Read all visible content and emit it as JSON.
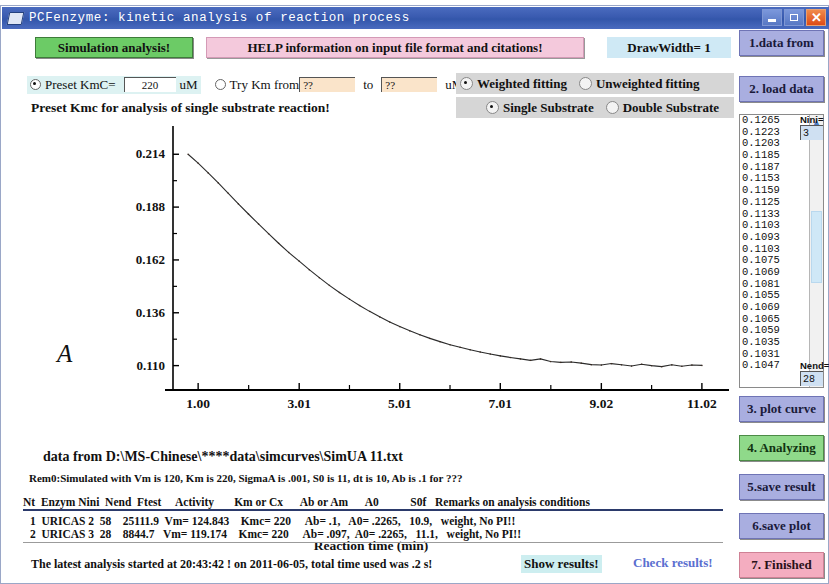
{
  "window": {
    "title": "PCFenzyme: kinetic analysis of reaction process",
    "minimize_label": "_",
    "maximize_label": "□",
    "close_label": "✕"
  },
  "toolbar": {
    "simulation_button": "Simulation analysis!",
    "help_button": "HELP information on input file format and citations!",
    "drawwidth_label": "DrawWidth= 1"
  },
  "options": {
    "preset_kmc_label": "Preset KmC=",
    "preset_kmc_value": "220",
    "preset_kmc_unit": "uM",
    "try_km_label": "Try Km from",
    "try_km_from_value": "??",
    "try_km_to_label": "to",
    "try_km_to_value": "??",
    "try_km_unit": "uM",
    "weighted_fitting": "Weighted fitting",
    "unweighted_fitting": "Unweighted fitting",
    "single_substrate": "Single Substrate",
    "double_substrate": "Double  Substrate",
    "hint": "Preset Kmc for analysis of single substrate reaction!"
  },
  "chart_data": {
    "type": "line",
    "title": "",
    "xlabel": "Reaction time (min)",
    "ylabel": "A",
    "xticks": [
      "1.00",
      "3.01",
      "5.01",
      "7.01",
      "9.02",
      "11.02"
    ],
    "xtick_values": [
      1.0,
      3.01,
      5.01,
      7.01,
      9.02,
      11.02
    ],
    "yticks": [
      "0.214",
      "0.188",
      "0.162",
      "0.136",
      "0.110"
    ],
    "ytick_values": [
      0.214,
      0.188,
      0.162,
      0.136,
      0.11
    ],
    "xlim": [
      0.5,
      11.4
    ],
    "ylim": [
      0.098,
      0.222
    ],
    "grid": false,
    "legend": null,
    "series": [
      {
        "name": "Absorbance decay",
        "x": [
          0.8,
          1.0,
          1.2,
          1.4,
          1.6,
          1.8,
          2.0,
          2.2,
          2.4,
          2.6,
          2.8,
          3.01,
          3.21,
          3.41,
          3.61,
          3.81,
          4.01,
          4.21,
          4.41,
          4.61,
          4.81,
          5.01,
          5.21,
          5.41,
          5.61,
          5.81,
          6.01,
          6.21,
          6.41,
          6.61,
          6.81,
          7.01,
          7.21,
          7.41,
          7.61,
          7.81,
          8.01,
          8.21,
          8.42,
          8.62,
          8.82,
          9.02,
          9.22,
          9.42,
          9.62,
          9.82,
          10.02,
          10.22,
          10.42,
          10.62,
          10.82,
          11.02
        ],
        "y": [
          0.214,
          0.2096,
          0.2048,
          0.1999,
          0.1948,
          0.1896,
          0.1846,
          0.1797,
          0.1749,
          0.1702,
          0.1657,
          0.1614,
          0.1572,
          0.1533,
          0.1495,
          0.146,
          0.1427,
          0.1396,
          0.1367,
          0.134,
          0.1315,
          0.1292,
          0.1271,
          0.1252,
          0.1234,
          0.1218,
          0.1203,
          0.119,
          0.1178,
          0.1167,
          0.1157,
          0.1148,
          0.114,
          0.1133,
          0.1126,
          0.1133,
          0.112,
          0.1116,
          0.1118,
          0.1112,
          0.1105,
          0.1103,
          0.111,
          0.1104,
          0.1098,
          0.1107,
          0.11,
          0.1095,
          0.1104,
          0.1097,
          0.1103,
          0.1101
        ]
      }
    ]
  },
  "footer": {
    "data_from": "data from D:\\MS-Chinese\\****data\\simcurves\\SimUA 11.txt",
    "rem0": "Rem0:Simulated with Vm is  120, Km is  220, SigmaA is .001, S0 is  11, dt is 10, Ab is  .1 for ???"
  },
  "results_table": {
    "header": "Nt  Enzym Nini  Nend  Ftest     Activity       Km or Cx      Ab or Am      A0           S0f   Remarks on analysis conditions",
    "rows": [
      " 1  URICAS 2  58    25111.9  Vm= 124.843    Kmc= 220     Ab= .1,   A0= .2265,   10.9,   weight, No PI!!",
      " 2  URICAS 3  28    8844.7   Vm= 119.174    Kmc= 220     Ab= .097,  A0= .2265,   11.1,   weight, No PI!!"
    ]
  },
  "status_bar": {
    "message": "The latest analysis started at  20:43:42 !  on 2011-06-05, total time used was  .2 s!",
    "show_results": "Show results!",
    "check_results": "Check results!"
  },
  "sidebar": {
    "buttons": [
      {
        "label": "1.data from",
        "top": 0,
        "style": "blue"
      },
      {
        "label": "2. load data",
        "top": 46,
        "style": "blue"
      },
      {
        "label": "3. plot curve",
        "top": 366,
        "style": "blue"
      },
      {
        "label": "4. Analyzing",
        "top": 405,
        "style": "green"
      },
      {
        "label": "5.save result",
        "top": 444,
        "style": "blue"
      },
      {
        "label": "6.save  plot",
        "top": 483,
        "style": "blue"
      },
      {
        "label": "7.  Finished",
        "top": 522,
        "style": "pink"
      }
    ],
    "data_list": [
      "0.1265",
      "0.1223",
      "0.1203",
      "0.1185",
      "0.1187",
      "0.1153",
      "0.1159",
      "0.1125",
      "0.1133",
      "0.1103",
      "0.1093",
      "0.1103",
      "0.1075",
      "0.1069",
      "0.1081",
      "0.1055",
      "0.1069",
      "0.1065",
      "0.1059",
      "0.1035",
      "0.1031",
      "0.1047"
    ],
    "nini_label": "Nini=",
    "nini_value": "3",
    "nend_label": "Nend=",
    "nend_value": "28",
    "scroll_up": "▲",
    "scroll_down": "▼"
  }
}
